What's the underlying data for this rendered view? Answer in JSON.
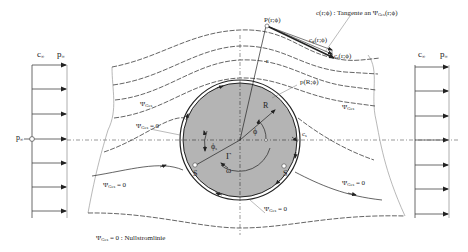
{
  "diagram": {
    "type": "potential flow around a rotating cylinder",
    "colors": {
      "line": "#222222",
      "cylinder_fill": "#b4b4b4",
      "light_line": "#888888",
      "background": "#ffffff"
    },
    "inflow_panel": {
      "c_label": "c",
      "c_sub": "∞",
      "p_label": "p",
      "p_sub": "∞",
      "side_label": "p",
      "side_sub": "∞"
    },
    "outflow_panel": {
      "c_label": "c",
      "c_sub": "∞",
      "p_label": "p",
      "p_sub": "∞"
    },
    "labels": {
      "point_P": "P(r;ϕ)",
      "tangent_note": "c(r;ϕ) : Tangente an Ψ",
      "tangent_note_sub": "Ges",
      "tangent_note_tail": "(r;ϕ)",
      "c_phi": "c",
      "c_phi_sub": "ϕ",
      "c_phi_tail": "(r;ϕ)",
      "c_r": "c",
      "c_r_sub": "r",
      "c_r_tail": "(r;ϕ)",
      "p_surface": "p(R;ϕ)",
      "radius_r": "r",
      "radius_R": "R",
      "angle_phi": "ϕ",
      "angle_phi_s": "ϕ",
      "angle_phi_s_sub": "s",
      "circulation": "Γ",
      "omega": "ω",
      "stagnation_left": "S",
      "stagnation_right": "S",
      "c_s": "c",
      "c_s_sub": "s",
      "psi_upper": "Ψ",
      "psi_upper_sub": "Ges",
      "psi_right_upper": "Ψ",
      "psi_right_upper_sub": "Ges",
      "psi_zero_left_upper": "Ψ",
      "psi_zero_left_upper_sub": "Ges",
      "psi_zero_left_upper_tail": "= 0",
      "psi_zero_left_lower": "Ψ",
      "psi_zero_left_lower_sub": "Ges",
      "psi_zero_left_lower_tail": "= 0",
      "psi_zero_right": "Ψ",
      "psi_zero_right_sub": "Ges",
      "psi_zero_right_tail": "= 0",
      "psi_zero_bottom": "Ψ",
      "psi_zero_bottom_sub": "Ges",
      "psi_zero_bottom_tail": "= 0"
    },
    "legend": {
      "symbol": "Ψ",
      "symbol_sub": "Ges",
      "text": "= 0 : Nullstromlinie"
    }
  }
}
